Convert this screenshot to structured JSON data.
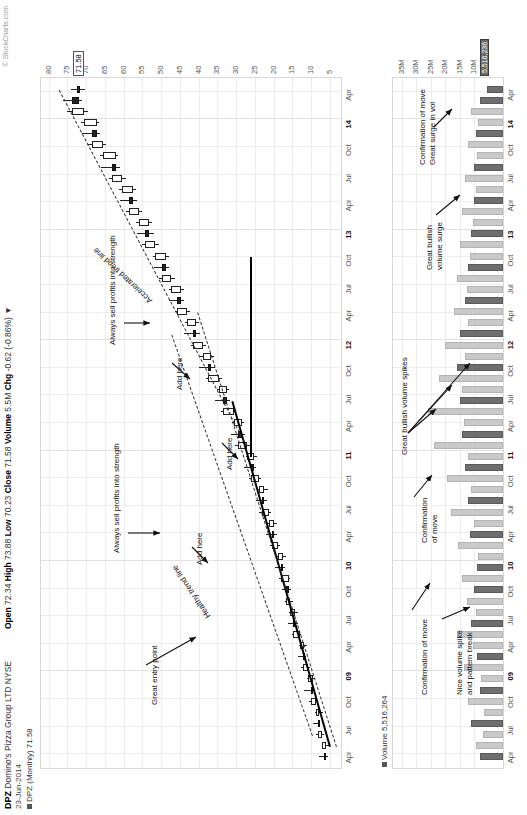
{
  "header": {
    "symbol": "DPZ",
    "company": "Domino's Pizza Group LTD NYSE",
    "date": "23-Jun-2014",
    "series_label": "DPZ (Monthly) 71.58",
    "credit": "© StockCharts.com",
    "quote": "Open 72.34 High 73.88 Low 70.23 Close 71.58 Volume 5.5M Chg -0.62 (-0.86%) ▼",
    "quote_parts": {
      "open_label": "Open",
      "open": "72.34",
      "high_label": "High",
      "high": "73.88",
      "low_label": "Low",
      "low": "70.23",
      "close_label": "Close",
      "close": "71.58",
      "volume_label": "Volume",
      "volume": "5.5M",
      "chg_label": "Chg",
      "chg": "-0.62 (-0.86%) ▼"
    },
    "volume_caption": "Volume 5,516,264",
    "current_price_tag": "71.58",
    "current_volume_tag": "5,516,236"
  },
  "chart_data": {
    "type": "line",
    "subtype": "candlestick+volume",
    "xlabel": "",
    "ylabel": "Price (USD)",
    "grid": true,
    "legend": "none",
    "price_axis": {
      "ticks": [
        "80",
        "75",
        "70",
        "65",
        "60",
        "55",
        "50",
        "45",
        "40",
        "35",
        "30",
        "25",
        "20",
        "15",
        "10",
        "5"
      ],
      "ylim": [
        2,
        82
      ]
    },
    "volume_axis": {
      "ticks": [
        "35M",
        "30M",
        "25M",
        "20M",
        "15M",
        "10M"
      ],
      "ylim": [
        0,
        38
      ]
    },
    "x_ticks": [
      "Apr",
      "Jul",
      "Oct",
      "09",
      "Apr",
      "Jul",
      "Oct",
      "10",
      "Apr",
      "Jul",
      "Oct",
      "11",
      "Apr",
      "Jul",
      "Oct",
      "12",
      "Apr",
      "Jul",
      "Oct",
      "13",
      "Apr",
      "Jul",
      "Oct",
      "14",
      "Apr"
    ],
    "year_ticks": [
      "09",
      "10",
      "11",
      "12",
      "13",
      "14"
    ],
    "candles": [
      {
        "o": 6.5,
        "h": 8.0,
        "l": 5.6,
        "c": 6.0,
        "v": 8.0
      },
      {
        "o": 6.0,
        "h": 7.2,
        "l": 5.0,
        "c": 7.0,
        "v": 9.5
      },
      {
        "o": 7.0,
        "h": 8.6,
        "l": 6.6,
        "c": 8.2,
        "v": 7.0
      },
      {
        "o": 8.2,
        "h": 9.4,
        "l": 7.5,
        "c": 8.0,
        "v": 11.0
      },
      {
        "o": 8.0,
        "h": 9.0,
        "l": 6.8,
        "c": 8.8,
        "v": 6.5
      },
      {
        "o": 8.8,
        "h": 10.5,
        "l": 8.4,
        "c": 10.0,
        "v": 12.0
      },
      {
        "o": 10.0,
        "h": 11.8,
        "l": 9.2,
        "c": 9.6,
        "v": 8.0
      },
      {
        "o": 9.6,
        "h": 11.0,
        "l": 9.0,
        "c": 10.8,
        "v": 7.5
      },
      {
        "o": 10.8,
        "h": 12.6,
        "l": 10.3,
        "c": 12.2,
        "v": 13.5
      },
      {
        "o": 12.2,
        "h": 13.6,
        "l": 11.4,
        "c": 11.8,
        "v": 9.0
      },
      {
        "o": 11.8,
        "h": 13.2,
        "l": 11.0,
        "c": 13.0,
        "v": 10.5
      },
      {
        "o": 13.0,
        "h": 15.2,
        "l": 12.6,
        "c": 14.8,
        "v": 16.0
      },
      {
        "o": 14.8,
        "h": 16.2,
        "l": 13.6,
        "c": 14.2,
        "v": 11.0
      },
      {
        "o": 14.2,
        "h": 15.8,
        "l": 13.4,
        "c": 15.5,
        "v": 9.5
      },
      {
        "o": 15.5,
        "h": 17.0,
        "l": 14.8,
        "c": 16.6,
        "v": 12.5
      },
      {
        "o": 16.6,
        "h": 17.8,
        "l": 15.4,
        "c": 16.0,
        "v": 10.0
      },
      {
        "o": 16.0,
        "h": 18.5,
        "l": 15.6,
        "c": 18.0,
        "v": 14.0
      },
      {
        "o": 18.0,
        "h": 19.6,
        "l": 17.0,
        "c": 17.6,
        "v": 9.0
      },
      {
        "o": 17.6,
        "h": 19.0,
        "l": 16.8,
        "c": 18.8,
        "v": 8.5
      },
      {
        "o": 18.8,
        "h": 21.0,
        "l": 18.2,
        "c": 20.4,
        "v": 15.5
      },
      {
        "o": 20.4,
        "h": 22.0,
        "l": 19.0,
        "c": 19.8,
        "v": 11.5
      },
      {
        "o": 19.8,
        "h": 21.6,
        "l": 19.2,
        "c": 21.2,
        "v": 10.0
      },
      {
        "o": 21.2,
        "h": 23.8,
        "l": 20.6,
        "c": 23.2,
        "v": 18.0
      },
      {
        "o": 23.2,
        "h": 24.8,
        "l": 21.8,
        "c": 22.6,
        "v": 12.0
      },
      {
        "o": 22.6,
        "h": 24.2,
        "l": 21.6,
        "c": 24.0,
        "v": 11.0
      },
      {
        "o": 24.0,
        "h": 26.5,
        "l": 23.4,
        "c": 26.0,
        "v": 19.5
      },
      {
        "o": 26.0,
        "h": 28.0,
        "l": 24.6,
        "c": 25.2,
        "v": 13.0
      },
      {
        "o": 25.2,
        "h": 27.4,
        "l": 24.4,
        "c": 27.0,
        "v": 12.0
      },
      {
        "o": 27.0,
        "h": 30.2,
        "l": 26.2,
        "c": 29.6,
        "v": 24.0
      },
      {
        "o": 29.6,
        "h": 31.4,
        "l": 27.6,
        "c": 28.4,
        "v": 14.0
      },
      {
        "o": 28.4,
        "h": 31.0,
        "l": 27.8,
        "c": 30.6,
        "v": 13.5
      },
      {
        "o": 30.6,
        "h": 34.0,
        "l": 30.0,
        "c": 33.4,
        "v": 26.0
      },
      {
        "o": 33.4,
        "h": 35.6,
        "l": 31.6,
        "c": 32.4,
        "v": 15.0
      },
      {
        "o": 32.4,
        "h": 35.0,
        "l": 31.8,
        "c": 34.6,
        "v": 14.0
      },
      {
        "o": 34.6,
        "h": 38.0,
        "l": 33.8,
        "c": 37.4,
        "v": 22.0
      },
      {
        "o": 37.4,
        "h": 39.8,
        "l": 35.6,
        "c": 36.6,
        "v": 16.0
      },
      {
        "o": 36.6,
        "h": 39.6,
        "l": 36.0,
        "c": 38.8,
        "v": 13.0
      },
      {
        "o": 38.8,
        "h": 42.0,
        "l": 38.0,
        "c": 41.4,
        "v": 20.0
      },
      {
        "o": 41.4,
        "h": 44.0,
        "l": 39.6,
        "c": 40.6,
        "v": 15.0
      },
      {
        "o": 40.6,
        "h": 43.6,
        "l": 40.0,
        "c": 43.0,
        "v": 12.0
      },
      {
        "o": 43.0,
        "h": 46.4,
        "l": 42.2,
        "c": 45.8,
        "v": 17.0
      },
      {
        "o": 45.8,
        "h": 48.0,
        "l": 43.8,
        "c": 44.8,
        "v": 13.0
      },
      {
        "o": 44.8,
        "h": 48.0,
        "l": 44.0,
        "c": 47.4,
        "v": 12.5
      },
      {
        "o": 47.4,
        "h": 50.6,
        "l": 46.4,
        "c": 49.8,
        "v": 16.0
      },
      {
        "o": 49.8,
        "h": 52.0,
        "l": 47.8,
        "c": 48.8,
        "v": 12.0
      },
      {
        "o": 48.8,
        "h": 52.2,
        "l": 48.0,
        "c": 51.6,
        "v": 11.5
      },
      {
        "o": 51.6,
        "h": 55.0,
        "l": 50.6,
        "c": 54.2,
        "v": 15.0
      },
      {
        "o": 54.2,
        "h": 56.4,
        "l": 52.0,
        "c": 53.2,
        "v": 11.0
      },
      {
        "o": 53.2,
        "h": 56.6,
        "l": 52.4,
        "c": 56.0,
        "v": 10.5
      },
      {
        "o": 56.0,
        "h": 59.4,
        "l": 55.0,
        "c": 58.6,
        "v": 14.0
      },
      {
        "o": 58.6,
        "h": 61.0,
        "l": 56.4,
        "c": 57.4,
        "v": 10.0
      },
      {
        "o": 57.4,
        "h": 61.2,
        "l": 56.8,
        "c": 60.4,
        "v": 9.5
      },
      {
        "o": 60.4,
        "h": 64.0,
        "l": 59.4,
        "c": 63.2,
        "v": 13.0
      },
      {
        "o": 63.2,
        "h": 66.0,
        "l": 61.0,
        "c": 62.0,
        "v": 10.0
      },
      {
        "o": 62.0,
        "h": 66.2,
        "l": 61.4,
        "c": 65.6,
        "v": 9.0
      },
      {
        "o": 65.6,
        "h": 69.4,
        "l": 64.6,
        "c": 68.4,
        "v": 12.0
      },
      {
        "o": 68.4,
        "h": 71.0,
        "l": 66.2,
        "c": 67.2,
        "v": 9.5
      },
      {
        "o": 67.2,
        "h": 71.4,
        "l": 66.6,
        "c": 70.6,
        "v": 8.5
      },
      {
        "o": 70.6,
        "h": 75.0,
        "l": 69.6,
        "c": 73.8,
        "v": 11.0
      },
      {
        "o": 73.8,
        "h": 76.2,
        "l": 71.0,
        "c": 72.0,
        "v": 8.0
      },
      {
        "o": 72.34,
        "h": 73.88,
        "l": 70.23,
        "c": 71.58,
        "v": 5.5
      }
    ],
    "annotations": [
      {
        "id": "great-entry-point",
        "text": "Great entry point"
      },
      {
        "id": "healthy-trend-line",
        "text": "Healthy trend line"
      },
      {
        "id": "always-sell-1",
        "text": "Always sell profits into strength"
      },
      {
        "id": "add-here-1",
        "text": "Add here"
      },
      {
        "id": "add-here-2",
        "text": "Add here"
      },
      {
        "id": "add-here-3",
        "text": "Add here"
      },
      {
        "id": "always-sell-2",
        "text": "Always sell profits into strength"
      },
      {
        "id": "accelerated-trend-line",
        "text": "Accelerated trend line"
      },
      {
        "id": "nice-volume-spike",
        "text": "Nice volume spike\nand pattern break"
      },
      {
        "id": "confirmation-of-move-1",
        "text": "Confirmation of move"
      },
      {
        "id": "confirmation-of-move-2",
        "text": "Confirmation\nof move"
      },
      {
        "id": "great-bullish-volume-spikes",
        "text": "Great bullish volume spikes"
      },
      {
        "id": "great-bullish-volume-surge",
        "text": "Great bullish\nvolume surge"
      },
      {
        "id": "confirmation-surge",
        "text": "Confirmation of move\nGreat surge in vol"
      }
    ]
  },
  "colors": {
    "up_candle": "#ffffff",
    "down_candle": "#222222",
    "up_volume": "#c9c9c9",
    "down_volume": "#6e6e6e",
    "grid": "#ededed",
    "axis_text": "#555555",
    "annotation": "#111111"
  }
}
